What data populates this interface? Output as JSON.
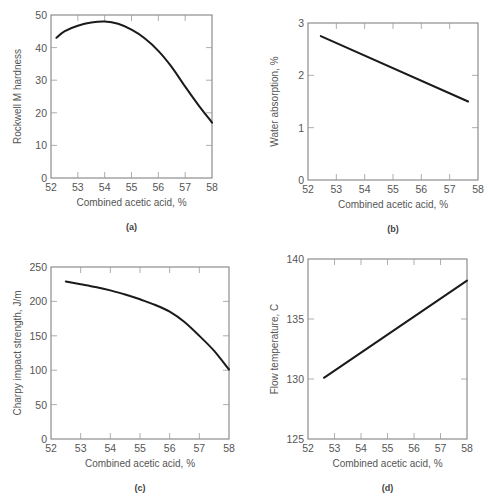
{
  "chart_data": [
    {
      "id": "a",
      "type": "line",
      "panel_label": "(a)",
      "title": "",
      "xlabel": "Combined acetic acid, %",
      "ylabel": "Rockwell M hardness",
      "xlim": [
        52,
        58
      ],
      "ylim": [
        0,
        50
      ],
      "xticks": [
        52,
        53,
        54,
        55,
        56,
        57,
        58
      ],
      "yticks": [
        0,
        10,
        20,
        30,
        40,
        50
      ],
      "grid": false,
      "x": [
        52.2,
        52.5,
        53,
        53.5,
        54,
        54.5,
        55,
        55.5,
        56,
        56.5,
        57,
        57.5,
        58
      ],
      "y": [
        43,
        45,
        46.7,
        47.7,
        48,
        47.3,
        45.5,
        42.8,
        39,
        34,
        28,
        22.3,
        17
      ]
    },
    {
      "id": "b",
      "type": "line",
      "panel_label": "(b)",
      "title": "",
      "xlabel": "Combined acetic acid, %",
      "ylabel": "Water absorption, %",
      "xlim": [
        52,
        58
      ],
      "ylim": [
        0,
        3
      ],
      "xticks": [
        52,
        53,
        54,
        55,
        56,
        57,
        58
      ],
      "yticks": [
        0,
        1,
        2,
        3
      ],
      "grid": false,
      "x": [
        52.45,
        57.65
      ],
      "y": [
        2.75,
        1.5
      ]
    },
    {
      "id": "c",
      "type": "line",
      "panel_label": "(c)",
      "title": "",
      "xlabel": "Combined acetic acid, %",
      "ylabel": "Charpy impact strength, J/m",
      "xlim": [
        52,
        58
      ],
      "ylim": [
        0,
        250
      ],
      "xticks": [
        52,
        53,
        54,
        55,
        56,
        57,
        58
      ],
      "yticks": [
        0,
        50,
        100,
        150,
        200,
        250
      ],
      "grid": false,
      "x": [
        52.5,
        53,
        53.5,
        54,
        54.5,
        55,
        55.5,
        56,
        56.5,
        57,
        57.5,
        58
      ],
      "y": [
        229,
        225,
        221,
        216,
        210,
        203,
        195,
        185,
        170,
        150,
        128,
        101
      ]
    },
    {
      "id": "d",
      "type": "line",
      "panel_label": "(d)",
      "title": "",
      "xlabel": "Combined acetic acid, %",
      "ylabel": "Flow temperature, C",
      "xlim": [
        52,
        58
      ],
      "ylim": [
        125,
        140
      ],
      "xticks": [
        52,
        53,
        54,
        55,
        56,
        57,
        58
      ],
      "yticks": [
        125,
        130,
        135,
        140
      ],
      "grid": false,
      "x": [
        52.6,
        58
      ],
      "y": [
        130.1,
        138.2
      ]
    }
  ],
  "layout": {
    "panels": [
      {
        "id": "a",
        "frame": {
          "left": 51,
          "top": 15,
          "right": 212,
          "bottom": 178
        }
      },
      {
        "id": "b",
        "frame": {
          "left": 308,
          "top": 23,
          "right": 478,
          "bottom": 180
        }
      },
      {
        "id": "c",
        "frame": {
          "left": 51,
          "top": 267,
          "right": 229,
          "bottom": 439
        }
      },
      {
        "id": "d",
        "frame": {
          "left": 308,
          "top": 259,
          "right": 467,
          "bottom": 439
        }
      }
    ]
  }
}
